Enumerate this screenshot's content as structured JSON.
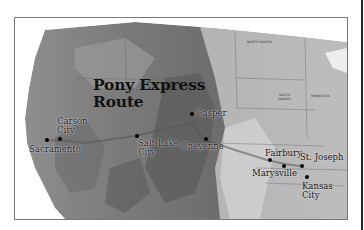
{
  "map": {
    "title_line1": "Pony Express",
    "title_line2": "Route",
    "cities": [
      {
        "name": "Sacramento",
        "line1": "Sacramento",
        "line2": ""
      },
      {
        "name": "Carson City",
        "line1": "Carson",
        "line2": "City"
      },
      {
        "name": "Salt Lake City",
        "line1": "Salt Lake",
        "line2": "City"
      },
      {
        "name": "Casper",
        "line1": "Casper",
        "line2": ""
      },
      {
        "name": "Cheyenne",
        "line1": "Cheyenne",
        "line2": ""
      },
      {
        "name": "Fairbury",
        "line1": "Fairbury",
        "line2": ""
      },
      {
        "name": "Marysville",
        "line1": "Marysville",
        "line2": ""
      },
      {
        "name": "St. Joseph",
        "line1": "St. Joseph",
        "line2": ""
      },
      {
        "name": "Kansas City",
        "line1": "Kansas",
        "line2": "City"
      }
    ],
    "state_labels": {
      "north_dakota": "NORTH DAKOTA",
      "south_dakota_1": "SOUTH",
      "south_dakota_2": "DAKOTA",
      "minnesota": "MINNESOTA"
    },
    "colors": {
      "terrain_dark": "#5a5a5a",
      "terrain_mid": "#8a8a8a",
      "terrain_light": "#b5b5b5",
      "plains": "#c8c8c8",
      "route": "#555555",
      "frame": "#777777"
    }
  }
}
